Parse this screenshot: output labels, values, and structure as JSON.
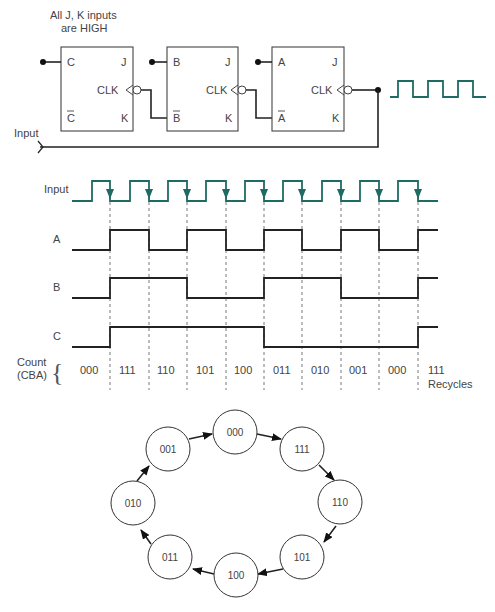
{
  "circuit": {
    "note_line1": "All J, K inputs",
    "note_line2": "are HIGH",
    "input_label": "Input",
    "flip_flops": [
      {
        "name": "C",
        "q": "C",
        "qbar": "C",
        "j": "J",
        "k": "K",
        "clk": "CLK"
      },
      {
        "name": "B",
        "q": "B",
        "qbar": "B",
        "j": "J",
        "k": "K",
        "clk": "CLK"
      },
      {
        "name": "A",
        "q": "A",
        "qbar": "A",
        "j": "J",
        "k": "K",
        "clk": "CLK"
      }
    ]
  },
  "timing": {
    "signals": [
      "Input",
      "A",
      "B",
      "C"
    ],
    "count_label_line1": "Count",
    "count_label_line2": "(CBA)",
    "counts": [
      "000",
      "111",
      "110",
      "101",
      "100",
      "011",
      "010",
      "001",
      "000",
      "111"
    ],
    "recycles_label": "Recycles",
    "colors": {
      "clock": "#1e6b63",
      "signal": "#222222"
    }
  },
  "state_diagram": {
    "states": [
      "000",
      "111",
      "110",
      "101",
      "100",
      "011",
      "010",
      "001"
    ]
  }
}
